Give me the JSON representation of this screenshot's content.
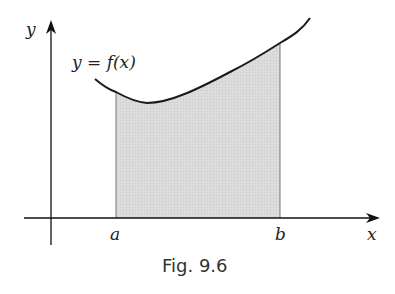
{
  "figure": {
    "caption": "Fig. 9.6",
    "function_label": "y = f(x)",
    "axis_labels": {
      "x": "x",
      "y": "y"
    },
    "bounds": {
      "lower": "a",
      "upper": "b"
    }
  },
  "colors": {
    "axis": "#111111",
    "curve": "#1a1a1a",
    "shaded_region": "#d9d9d9"
  }
}
